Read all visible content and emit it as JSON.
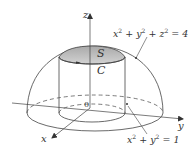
{
  "figure": {
    "type": "3d-surface-diagram",
    "colors": {
      "stroke": "#444444",
      "cap_fill": "#b8b8b8",
      "cap_fill_light": "#d6d6d6",
      "background": "#ffffff"
    }
  },
  "labels": {
    "z_axis": "z",
    "y_axis": "y",
    "x_axis": "x",
    "origin": "0",
    "surface": "S",
    "curve": "C",
    "sphere_equation": {
      "parts": [
        "x",
        "2",
        " + y",
        "2",
        " + z",
        "2",
        " = 4"
      ]
    },
    "cylinder_equation": {
      "parts": [
        "x",
        "2",
        " + y",
        "2",
        " = 1"
      ]
    }
  }
}
